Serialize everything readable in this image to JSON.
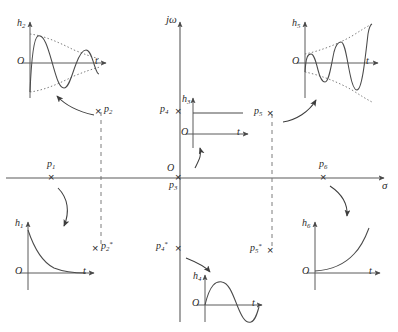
{
  "figure": {
    "plane_axes": {
      "imaginary_label": "jω",
      "real_label": "σ",
      "origin_label": "O"
    },
    "colors": {
      "line": "#4a4a4a",
      "axis": "#555555",
      "text": "#222222",
      "dashed": "#666666",
      "background": "#ffffff"
    },
    "poles": [
      {
        "id": "p1",
        "label": "p",
        "sub": "1",
        "star": false,
        "marker": "x"
      },
      {
        "id": "p2",
        "label": "p",
        "sub": "2",
        "star": false,
        "marker": "x"
      },
      {
        "id": "p2c",
        "label": "p",
        "sub": "2",
        "star": true,
        "marker": "x"
      },
      {
        "id": "p3",
        "label": "p",
        "sub": "3",
        "star": false,
        "marker": "x"
      },
      {
        "id": "p4",
        "label": "p",
        "sub": "4",
        "star": false,
        "marker": "x"
      },
      {
        "id": "p4c",
        "label": "p",
        "sub": "4",
        "star": true,
        "marker": "x"
      },
      {
        "id": "p5",
        "label": "p",
        "sub": "5",
        "star": false,
        "marker": "x"
      },
      {
        "id": "p5c",
        "label": "p",
        "sub": "5",
        "star": true,
        "marker": "x"
      },
      {
        "id": "p6",
        "label": "p",
        "sub": "6",
        "star": false,
        "marker": "x"
      }
    ],
    "responses": [
      {
        "id": "h1",
        "label": "h",
        "sub": "1",
        "origin_label": "O",
        "time_label": "t",
        "kind": "decaying-exponential"
      },
      {
        "id": "h2",
        "label": "h",
        "sub": "2",
        "origin_label": "O",
        "time_label": "t",
        "kind": "damped-oscillation"
      },
      {
        "id": "h3",
        "label": "h",
        "sub": "3",
        "origin_label": "O",
        "time_label": "t",
        "kind": "step"
      },
      {
        "id": "h4",
        "label": "h",
        "sub": "4",
        "origin_label": "O",
        "time_label": "t",
        "kind": "sinusoid"
      },
      {
        "id": "h5",
        "label": "h",
        "sub": "5",
        "origin_label": "O",
        "time_label": "t",
        "kind": "growing-oscillation"
      },
      {
        "id": "h6",
        "label": "h",
        "sub": "6",
        "origin_label": "O",
        "time_label": "t",
        "kind": "growing-exponential"
      }
    ],
    "labels": {
      "jw": "jω",
      "sigma": "σ",
      "O": "O",
      "t": "t",
      "h": "h",
      "p": "p",
      "star": "*",
      "s1": "1",
      "s2": "2",
      "s3": "3",
      "s4": "4",
      "s5": "5",
      "s6": "6"
    }
  }
}
